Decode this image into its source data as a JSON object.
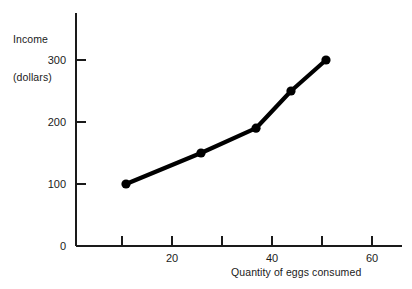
{
  "chart_data": {
    "type": "line",
    "title": "",
    "xlabel": "Quantity of eggs consumed",
    "ylabel": "Income\n(dollars)",
    "ylabel_lines": [
      "Income",
      "(dollars)"
    ],
    "x": [
      10,
      25,
      36,
      43,
      50
    ],
    "values": [
      100,
      150,
      190,
      250,
      300
    ],
    "series": [
      {
        "name": "Income",
        "x": [
          10,
          25,
          36,
          43,
          50
        ],
        "values": [
          100,
          150,
          190,
          250,
          300
        ]
      }
    ],
    "points": [
      {
        "x": 10,
        "y": 100
      },
      {
        "x": 25,
        "y": 150
      },
      {
        "x": 36,
        "y": 190
      },
      {
        "x": 43,
        "y": 250
      },
      {
        "x": 50,
        "y": 300
      }
    ],
    "xlim": [
      0,
      66
    ],
    "ylim": [
      0,
      325
    ],
    "xticks": [
      10,
      20,
      30,
      40,
      50,
      60
    ],
    "xtick_labels": [
      "",
      "20",
      "",
      "40",
      "",
      "60"
    ],
    "yticks": [
      0,
      100,
      200,
      300
    ],
    "ytick_labels": [
      "0",
      "100",
      "200",
      "300"
    ],
    "grid": false,
    "legend": false,
    "legend_position": "none",
    "line_color": "#000000",
    "marker": "circle",
    "marker_color": "#000000",
    "axis_color": "#1a1a1a",
    "background_color": "#ffffff"
  },
  "labels": {
    "y_axis_line1": "Income",
    "y_axis_line2": "(dollars)",
    "x_axis": "Quantity of eggs consumed",
    "y_0": "0",
    "y_100": "100",
    "y_200": "200",
    "y_300": "300",
    "x_20": "20",
    "x_40": "40",
    "x_60": "60"
  }
}
